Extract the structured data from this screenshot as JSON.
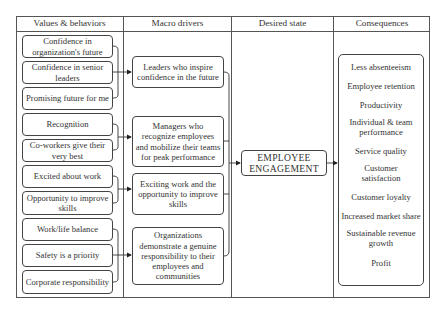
{
  "columns": [
    {
      "label": "Values & behaviors"
    },
    {
      "label": "Macro drivers"
    },
    {
      "label": "Desired state"
    },
    {
      "label": "Consequences"
    }
  ],
  "values_behaviors": [
    {
      "label": "Confidence in organization's future"
    },
    {
      "label": "Confidence in senior leaders"
    },
    {
      "label": "Promising future for me"
    },
    {
      "label": "Recognition"
    },
    {
      "label": "Co-workers give their very best"
    },
    {
      "label": "Excited about work"
    },
    {
      "label": "Opportunity to improve skills"
    },
    {
      "label": "Work/life balance"
    },
    {
      "label": "Safety is a priority"
    },
    {
      "label": "Corporate responsibility"
    }
  ],
  "macro_drivers": [
    {
      "label": "Leaders who inspire confidence in the future"
    },
    {
      "label": "Managers who recognize employees and mobilize their teams for peak performance"
    },
    {
      "label": "Exciting work and the opportunity to improve skills"
    },
    {
      "label": "Organizations demonstrate a genuine responsibility to their employees and communities"
    }
  ],
  "desired_state": {
    "label": "EMPLOYEE ENGAGEMENT"
  },
  "consequences": [
    {
      "label": "Less absenteeism"
    },
    {
      "label": "Employee retention"
    },
    {
      "label": "Productivity"
    },
    {
      "label": "Individual & team performance"
    },
    {
      "label": "Service quality"
    },
    {
      "label": "Customer satisfaction"
    },
    {
      "label": "Customer loyalty"
    },
    {
      "label": "Increased market share"
    },
    {
      "label": "Sustainable revenue growth"
    },
    {
      "label": "Profit"
    }
  ]
}
